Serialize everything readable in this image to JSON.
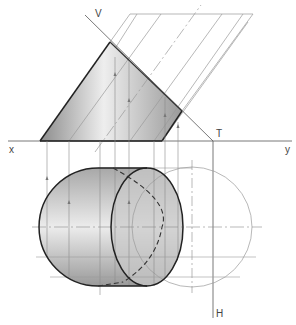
{
  "diagram": {
    "type": "orthographic-projection",
    "labels": {
      "v": "V",
      "t": "T",
      "x": "x",
      "y": "y",
      "h": "H"
    },
    "colors": {
      "outline": "#222222",
      "thin": "#9a9a9a",
      "shade_dark": "#8f8f8f",
      "shade_light": "#ececec",
      "background": "#ffffff"
    },
    "views": {
      "front_elevation": {
        "shape": "quadrilateral",
        "points": [
          [
            40,
            141
          ],
          [
            110,
            42
          ],
          [
            182,
            111
          ],
          [
            162,
            141
          ]
        ]
      },
      "plan": {
        "left_arc_center": [
          98,
          227
        ],
        "radius": 59,
        "ellipse_center": [
          147,
          227
        ],
        "ellipse_rx": 36,
        "circle_center": [
          192,
          227
        ]
      }
    }
  }
}
